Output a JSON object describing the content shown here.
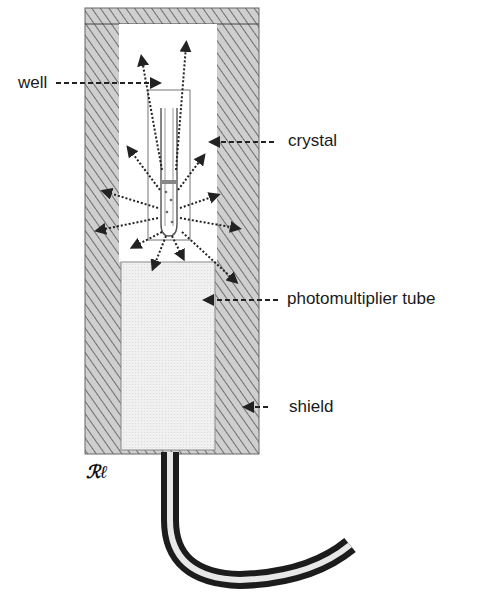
{
  "diagram": {
    "labels": {
      "well": "well",
      "crystal": "crystal",
      "photomultiplier_tube": "photomultiplier tube",
      "shield": "shield"
    },
    "signature": "RP",
    "colors": {
      "shield_fill": "#c8c8c8",
      "hatch": "#555555",
      "crystal_fill": "#ffffff",
      "pmt_fill": "#ececec",
      "arrow": "#222222",
      "text": "#1a1a1a"
    }
  }
}
